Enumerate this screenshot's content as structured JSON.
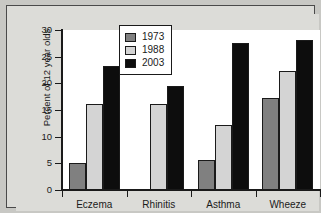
{
  "chart_data": {
    "type": "bar",
    "title": "",
    "subtitle": "",
    "xlabel": "",
    "ylabel": "Percent of 12 year olds",
    "categories": [
      "Eczema",
      "Rhinitis",
      "Asthma",
      "Wheeze"
    ],
    "series": [
      {
        "name": "1973",
        "color": "#808080",
        "values": [
          5.0,
          null,
          5.6,
          17.2
        ]
      },
      {
        "name": "1988",
        "color": "#d4d4d4",
        "values": [
          16.1,
          16.1,
          12.1,
          22.4
        ]
      },
      {
        "name": "2003",
        "color": "#0d0d0d",
        "values": [
          23.3,
          19.5,
          27.5,
          28.1
        ]
      }
    ],
    "ylim": [
      0,
      30
    ],
    "yticks": [
      0,
      5,
      10,
      15,
      20,
      25,
      30
    ],
    "ytick_labels": [
      "0",
      "5",
      "10",
      "15",
      "20",
      "25",
      "30"
    ],
    "grid": false,
    "legend_position": "top-center",
    "legend_entries": [
      "1973",
      "1988",
      "2003"
    ],
    "annotations": []
  },
  "colors": {
    "background": "#c8c8c4",
    "panel": "#dcdcd8",
    "plot_background": "#ffffff",
    "axis": "#1a1a1a",
    "series_1973": "#808080",
    "series_1988": "#d4d4d4",
    "series_2003": "#0d0d0d"
  }
}
